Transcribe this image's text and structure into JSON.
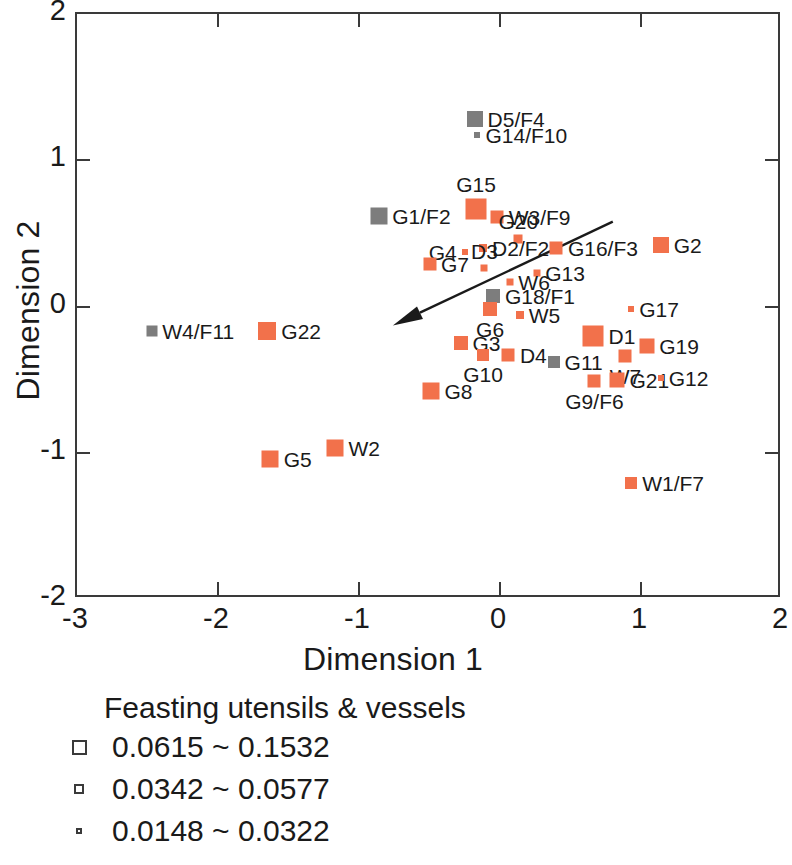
{
  "chart_data": {
    "type": "scatter",
    "title": "",
    "xlabel": "Dimension 1",
    "ylabel": "Dimension 2",
    "xlim": [
      -3,
      2
    ],
    "ylim": [
      -2,
      2
    ],
    "xticks": [
      "-3",
      "-2",
      "-1",
      "0",
      "1",
      "2"
    ],
    "xtick_values": [
      -3,
      -2,
      -1,
      0,
      1,
      2
    ],
    "yticks": [
      "2",
      "1",
      "0",
      "-1",
      "-2"
    ],
    "ytick_values": [
      2,
      1,
      0,
      -1,
      -2
    ],
    "grid": false,
    "legend_position": "below-plot",
    "marker_shape": "square",
    "colors": {
      "orange": "#f2714b",
      "gray": "#7d7d7d",
      "axis": "#3a3a3a",
      "text": "#1a1a1a"
    },
    "size_classes": [
      {
        "range_label": "0.0615 ~ 0.1532",
        "px": 20,
        "legend_px": 15
      },
      {
        "range_label": "0.0342 ~ 0.0577",
        "px": 13,
        "legend_px": 10
      },
      {
        "range_label": "0.0148 ~ 0.0322",
        "px": 7,
        "legend_px": 6
      }
    ],
    "annotation_arrow": {
      "from_x": 0.8,
      "from_y": 0.58,
      "to_x": -0.76,
      "to_y": -0.13
    },
    "points": [
      {
        "label": "D5/F4",
        "x": -0.18,
        "y": 1.28,
        "color": "gray",
        "size": 16,
        "label_pos": "right"
      },
      {
        "label": "G14/F10",
        "x": -0.16,
        "y": 1.17,
        "color": "gray",
        "size": 6,
        "label_pos": "right"
      },
      {
        "label": "G15",
        "x": -0.17,
        "y": 0.67,
        "color": "orange",
        "size": 21,
        "label_pos": "above"
      },
      {
        "label": "W3/F9",
        "x": -0.02,
        "y": 0.61,
        "color": "orange",
        "size": 13,
        "label_pos": "right"
      },
      {
        "label": "G1/F2",
        "x": -0.86,
        "y": 0.62,
        "color": "gray",
        "size": 17,
        "label_pos": "right"
      },
      {
        "label": "G20",
        "x": 0.13,
        "y": 0.46,
        "color": "orange",
        "size": 9,
        "label_pos": "above"
      },
      {
        "label": "D2/F2",
        "x": -0.12,
        "y": 0.4,
        "color": "orange",
        "size": 8,
        "label_pos": "right"
      },
      {
        "label": "G4",
        "x": -0.25,
        "y": 0.37,
        "color": "orange",
        "size": 6,
        "label_pos": "left"
      },
      {
        "label": "G16/F3",
        "x": 0.4,
        "y": 0.4,
        "color": "orange",
        "size": 13,
        "label_pos": "right"
      },
      {
        "label": "G2",
        "x": 1.14,
        "y": 0.42,
        "color": "orange",
        "size": 16,
        "label_pos": "right"
      },
      {
        "label": "G7",
        "x": -0.5,
        "y": 0.29,
        "color": "orange",
        "size": 13,
        "label_pos": "right"
      },
      {
        "label": "D3",
        "x": -0.11,
        "y": 0.26,
        "color": "orange",
        "size": 7,
        "label_pos": "above"
      },
      {
        "label": "G13",
        "x": 0.26,
        "y": 0.23,
        "color": "orange",
        "size": 7,
        "label_pos": "right"
      },
      {
        "label": "W6",
        "x": 0.07,
        "y": 0.17,
        "color": "orange",
        "size": 7,
        "label_pos": "right"
      },
      {
        "label": "G18/F1",
        "x": -0.05,
        "y": 0.07,
        "color": "gray",
        "size": 14,
        "label_pos": "right"
      },
      {
        "label": "G6",
        "x": -0.07,
        "y": -0.02,
        "color": "orange",
        "size": 14,
        "label_pos": "below"
      },
      {
        "label": "W5",
        "x": 0.14,
        "y": -0.06,
        "color": "orange",
        "size": 8,
        "label_pos": "right"
      },
      {
        "label": "G17",
        "x": 0.93,
        "y": -0.02,
        "color": "orange",
        "size": 6,
        "label_pos": "right"
      },
      {
        "label": "W4/F11",
        "x": -2.47,
        "y": -0.17,
        "color": "gray",
        "size": 11,
        "label_pos": "right"
      },
      {
        "label": "G22",
        "x": -1.65,
        "y": -0.17,
        "color": "orange",
        "size": 18,
        "label_pos": "right"
      },
      {
        "label": "D1",
        "x": 0.66,
        "y": -0.2,
        "color": "orange",
        "size": 21,
        "label_pos": "right"
      },
      {
        "label": "G3",
        "x": -0.28,
        "y": -0.25,
        "color": "orange",
        "size": 14,
        "label_pos": "right"
      },
      {
        "label": "G19",
        "x": 1.04,
        "y": -0.27,
        "color": "orange",
        "size": 15,
        "label_pos": "right"
      },
      {
        "label": "W7",
        "x": 0.89,
        "y": -0.34,
        "color": "orange",
        "size": 13,
        "label_pos": "below"
      },
      {
        "label": "D4",
        "x": 0.06,
        "y": -0.33,
        "color": "orange",
        "size": 13,
        "label_pos": "right"
      },
      {
        "label": "G10",
        "x": -0.12,
        "y": -0.33,
        "color": "orange",
        "size": 12,
        "label_pos": "below"
      },
      {
        "label": "G11",
        "x": 0.38,
        "y": -0.38,
        "color": "gray",
        "size": 12,
        "label_pos": "right"
      },
      {
        "label": "G21",
        "x": 0.83,
        "y": -0.5,
        "color": "orange",
        "size": 15,
        "label_pos": "right"
      },
      {
        "label": "G9/F6",
        "x": 0.67,
        "y": -0.51,
        "color": "orange",
        "size": 13,
        "label_pos": "below"
      },
      {
        "label": "G12",
        "x": 1.14,
        "y": -0.49,
        "color": "orange",
        "size": 6,
        "label_pos": "right"
      },
      {
        "label": "G8",
        "x": -0.49,
        "y": -0.58,
        "color": "orange",
        "size": 17,
        "label_pos": "right"
      },
      {
        "label": "W2",
        "x": -1.17,
        "y": -0.97,
        "color": "orange",
        "size": 17,
        "label_pos": "right"
      },
      {
        "label": "G5",
        "x": -1.63,
        "y": -1.04,
        "color": "orange",
        "size": 17,
        "label_pos": "right"
      },
      {
        "label": "W1/F7",
        "x": 0.93,
        "y": -1.21,
        "color": "orange",
        "size": 12,
        "label_pos": "right"
      }
    ]
  },
  "legend": {
    "title": "Feasting utensils & vessels",
    "rows": [
      {
        "label": "0.0615 ~ 0.1532",
        "swatch_px": 15
      },
      {
        "label": "0.0342 ~ 0.0577",
        "swatch_px": 10
      },
      {
        "label": "0.0148 ~ 0.0322",
        "swatch_px": 6
      }
    ]
  }
}
